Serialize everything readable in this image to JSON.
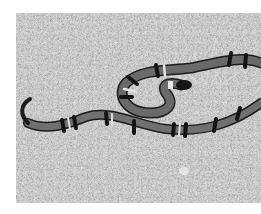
{
  "image": {
    "subject": "banded snake on gravel ground",
    "style": "grayscale photograph",
    "colors": {
      "background_margin": "#ffffff",
      "ground": "#bdbdbd",
      "ground_dark": "#9a9a9a",
      "snake_body": "#6a6a6a",
      "snake_band_dark": "#1e1e1e",
      "snake_band_light": "#e2e2e2"
    }
  }
}
